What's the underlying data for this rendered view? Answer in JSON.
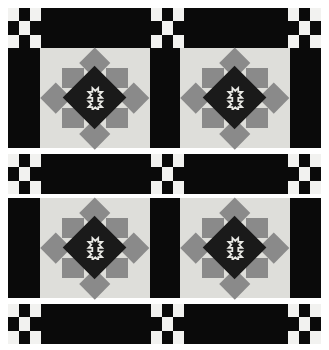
{
  "artwork": {
    "title": "Checkerboard Sash Star Quilt",
    "kind": "quilt-pattern",
    "canvas": {
      "width": 329,
      "height": 350,
      "background": "#ffffff"
    }
  },
  "palette": {
    "black": "#0a0a0a",
    "near_black": "#1a1a1a",
    "medium_gray": "#8a8a8a",
    "light_gray": "#dededa",
    "off_white": "#f2f2f0",
    "white": "#ffffff"
  },
  "layout": {
    "bands": [
      {
        "name": "top-border-sash",
        "type": "sash",
        "top": 8,
        "height": 40
      },
      {
        "name": "upper-block-row",
        "type": "blocks",
        "top": 48,
        "height": 100
      },
      {
        "name": "middle-sash",
        "type": "sash",
        "top": 154,
        "height": 40
      },
      {
        "name": "lower-block-row",
        "type": "blocks",
        "top": 198,
        "height": 100
      },
      {
        "name": "bottom-border-sash",
        "type": "sash",
        "top": 304,
        "height": 40
      }
    ],
    "sash_segments": [
      {
        "kind": "checker",
        "left": 8,
        "width": 33
      },
      {
        "kind": "bar",
        "left": 41,
        "width": 110
      },
      {
        "kind": "checker",
        "left": 151,
        "width": 33
      },
      {
        "kind": "bar",
        "left": 184,
        "width": 104
      },
      {
        "kind": "checker",
        "left": 288,
        "width": 33
      }
    ],
    "row_segments": [
      {
        "kind": "bar",
        "left": 8,
        "width": 32
      },
      {
        "kind": "block",
        "left": 40,
        "width": 110
      },
      {
        "kind": "bar",
        "left": 150,
        "width": 30
      },
      {
        "kind": "block",
        "left": 180,
        "width": 110
      },
      {
        "kind": "bar",
        "left": 290,
        "width": 31
      }
    ]
  },
  "checkerboard": {
    "name": "nine-patch-checkerboard",
    "rows": 3,
    "cols": 3,
    "cells": [
      "light",
      "dark",
      "light",
      "dark",
      "light",
      "dark",
      "light",
      "dark",
      "light"
    ]
  },
  "star_block": {
    "name": "variable-star-with-medallion",
    "grid": 5,
    "description": "Five-by-five star: light corner squares, medium-gray side squares, gray star points as on-point diamonds, black on-point center square holding a white cross medallion.",
    "parts": {
      "background": "light_gray",
      "star_points": "medium_gray",
      "side_squares": "medium_gray",
      "center": "near_black",
      "medallion_line": "#e8e8e4"
    }
  },
  "counts": {
    "star_blocks": 4,
    "checkerboard_units": 15,
    "sash_bands": 3,
    "block_rows": 2
  }
}
